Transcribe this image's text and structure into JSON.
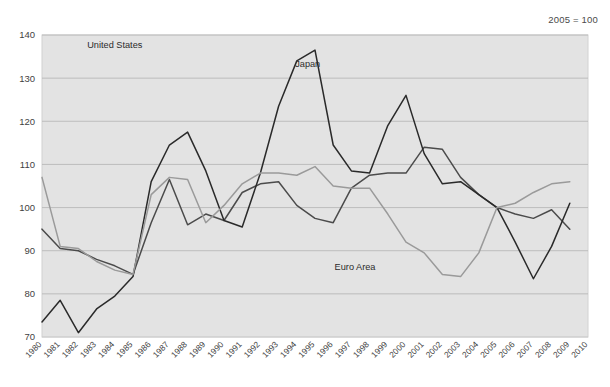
{
  "note": "2005 = 100",
  "chart_data": {
    "type": "line",
    "title": "",
    "subtitle": "",
    "xlabel": "",
    "ylabel": "",
    "grid": true,
    "legend_position": "inline-annotations",
    "xlim": [
      1980,
      2010
    ],
    "ylim": [
      70,
      140
    ],
    "ytick_step": 10,
    "yticks": [
      70,
      80,
      90,
      100,
      110,
      120,
      130,
      140
    ],
    "x": [
      1980,
      1981,
      1982,
      1983,
      1984,
      1985,
      1986,
      1987,
      1988,
      1989,
      1990,
      1991,
      1992,
      1993,
      1994,
      1995,
      1996,
      1997,
      1998,
      1999,
      2000,
      2001,
      2002,
      2003,
      2004,
      2005,
      2006,
      2007,
      2008,
      2009
    ],
    "xticks": [
      "1980",
      "1981",
      "1982",
      "1983",
      "1984",
      "1985",
      "1986",
      "1987",
      "1988",
      "1989",
      "1990",
      "1991",
      "1992",
      "1993",
      "1994",
      "1995",
      "1996",
      "1997",
      "1998",
      "1999",
      "2000",
      "2001",
      "2002",
      "2003",
      "2004",
      "2005",
      "2006",
      "2007",
      "2008",
      "2009",
      "2010"
    ],
    "series": [
      {
        "name": "United States",
        "color": "#4b4b4b",
        "label_x": 1984.0,
        "label_y": 137.0,
        "values": [
          95.0,
          90.5,
          90.0,
          88.0,
          86.5,
          84.5,
          96.5,
          106.5,
          96.0,
          98.5,
          97.0,
          103.5,
          105.5,
          106.0,
          100.5,
          97.5,
          96.5,
          104.5,
          107.5,
          108.0,
          108.0,
          114.0,
          113.5,
          107.0,
          103.0,
          100.0,
          98.5,
          97.5,
          99.5,
          95.0
        ]
      },
      {
        "name": "Japan",
        "color": "#2a2a2a",
        "label_x": 1994.6,
        "label_y": 132.5,
        "values": [
          73.5,
          78.5,
          71.0,
          76.5,
          79.5,
          84.0,
          106.0,
          114.5,
          117.5,
          108.5,
          97.0,
          95.5,
          108.0,
          123.5,
          134.0,
          136.5,
          114.5,
          108.5,
          108.0,
          119.0,
          126.0,
          112.5,
          105.5,
          106.0,
          103.0,
          100.0,
          92.0,
          83.5,
          91.0,
          101.0
        ]
      },
      {
        "name": "Euro Area",
        "color": "#9a9a9a",
        "label_x": 1997.2,
        "label_y": 85.5,
        "values": [
          107.0,
          91.0,
          90.5,
          87.5,
          85.5,
          84.5,
          103.0,
          107.0,
          106.5,
          96.5,
          100.5,
          105.5,
          108.0,
          108.0,
          107.5,
          109.5,
          105.0,
          104.5,
          104.5,
          98.5,
          92.0,
          89.5,
          84.5,
          84.0,
          89.5,
          100.0,
          101.0,
          103.5,
          105.5,
          106.0
        ]
      }
    ]
  }
}
